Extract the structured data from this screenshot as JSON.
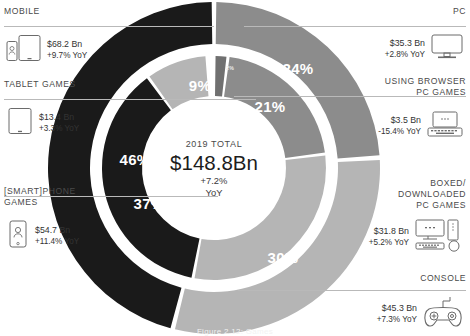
{
  "chart_data": {
    "type": "pie",
    "title": "2019 TOTAL",
    "subtitle": "$148.8Bn",
    "center_change": "+7.2%",
    "center_change_unit": "YoY",
    "total_value": "$148.8Bn",
    "year": "2019",
    "legend_position": "left and right margins",
    "grid": false,
    "rings": [
      {
        "name": "outer",
        "description": "Platform split",
        "segments": [
          {
            "label": "PC",
            "percent": 24,
            "percent_label": "24%",
            "value": "$35.3 Bn",
            "change": "+2.8% YoY",
            "color": "#8c8c8c"
          },
          {
            "label": "CONSOLE",
            "percent": 30,
            "percent_label": "30%",
            "value": "$45.3 Bn",
            "change": "+7.3% YoY",
            "color": "#b5b5b5"
          },
          {
            "label": "MOBILE",
            "percent": 46,
            "percent_label": "46%",
            "value": "$68.2 Bn",
            "change": "+9.7% YoY",
            "color": "#1a1a1a"
          }
        ]
      },
      {
        "name": "inner",
        "description": "Segment split",
        "segments": [
          {
            "label": "USING BROWSER PC GAMES",
            "percent": 2,
            "percent_label": "2%",
            "value": "$3.5 Bn",
            "change": "-15.4% YoY",
            "color": "#707070"
          },
          {
            "label": "BOXED/ DOWNLOADED PC GAMES",
            "percent": 21,
            "percent_label": "21%",
            "value": "$31.8 Bn",
            "change": "+5.2% YoY",
            "color": "#8c8c8c"
          },
          {
            "label": "CONSOLE",
            "percent": 30,
            "percent_label": "30%",
            "value": "$45.3 Bn",
            "change": "+7.3% YoY",
            "color": "#b5b5b5"
          },
          {
            "label": "[SMART]PHONE GAMES",
            "percent": 37,
            "percent_label": "37%",
            "value": "$54.7 Bn",
            "change": "+11.4% YoY",
            "color": "#1a1a1a"
          },
          {
            "label": "TABLET GAMES",
            "percent": 9,
            "percent_label": "9%",
            "value": "$13.4 Bn",
            "change": "+3.3% YoY",
            "color": "#b5b5b5"
          }
        ]
      }
    ]
  },
  "center": {
    "title": "2019 TOTAL",
    "amount": "$148.8Bn",
    "change": "+7.2%",
    "period": "YoY"
  },
  "labels_left": [
    {
      "key": "mobile",
      "header": "MOBILE",
      "value": "$68.2 Bn",
      "change": "+9.7% YoY",
      "icon": "phone-tablet-icon"
    },
    {
      "key": "tablet",
      "header": "TABLET GAMES",
      "value": "$13.4 Bn",
      "change": "+3.3% YoY",
      "icon": "tablet-icon"
    },
    {
      "key": "phone",
      "header": "[SMART]PHONE\nGAMES",
      "value": "$54.7 Bn",
      "change": "+11.4% YoY",
      "icon": "smartphone-icon"
    }
  ],
  "labels_right": [
    {
      "key": "pc",
      "header": "PC",
      "value": "$35.3 Bn",
      "change": "+2.8% YoY",
      "icon": "desktop-monitor-icon"
    },
    {
      "key": "browser",
      "header": "USING BROWSER\nPC GAMES",
      "value": "$3.5 Bn",
      "change": "-15.4% YoY",
      "icon": "laptop-icon"
    },
    {
      "key": "boxed",
      "header": "BOXED/\nDOWNLOADED\nPC GAMES",
      "value": "$31.8 Bn",
      "change": "+5.2% YoY",
      "icon": "desktop-tower-icon"
    },
    {
      "key": "console",
      "header": "CONSOLE",
      "value": "$45.3 Bn",
      "change": "+7.3% YoY",
      "icon": "gamepad-icon"
    }
  ],
  "ring_percent_labels": {
    "outer_mobile": "46%",
    "outer_pc": "24%",
    "outer_console": "30%",
    "inner_tablet": "9%",
    "inner_phone": "37%",
    "inner_browser": "2%",
    "inner_boxed": "21%",
    "inner_console": "30%"
  },
  "caption": "Figure 2.12: Games",
  "colors": {
    "black": "#1a1a1a",
    "dark_gray": "#707070",
    "mid_gray": "#8c8c8c",
    "light_gray": "#b5b5b5",
    "rule": "#b9b9b9",
    "background": "#ffffff"
  }
}
